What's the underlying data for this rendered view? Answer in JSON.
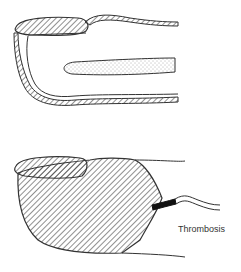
{
  "figure": {
    "panels": [
      {
        "id": "top",
        "description": "Normal fingertip cross-section with nail, dorsal/ventral skin walls and bone (stippled)"
      },
      {
        "id": "bottom",
        "description": "Fingertip fully hatched (infarct) with vessel thrombosis"
      }
    ],
    "labels": {
      "thrombosis": "Thrombosis"
    },
    "colors": {
      "line": "#333333",
      "background": "#ffffff"
    }
  }
}
